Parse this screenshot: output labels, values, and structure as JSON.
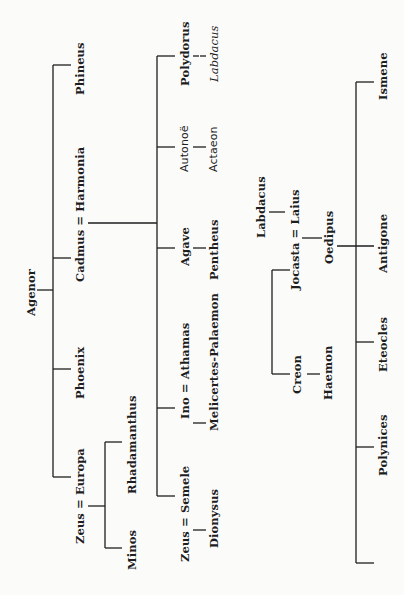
{
  "diagram": {
    "orientation": "rotated 90° counter-clockwise",
    "line_color": "#1e1e1e",
    "background": "#fbfbfa",
    "people": {
      "agenor": "Agenor",
      "phineus": "Phineus",
      "cadmus_harmonia": "Cadmus = Harmonia",
      "phoenix": "Phoenix",
      "zeus_europa": "Zeus = Europa",
      "minos": "Minos",
      "rhadamanthus": "Rhadamanthus",
      "polydorus": "Polydorus",
      "labdacus_italic": "Labdacus",
      "autonoe": "Autonoë",
      "actaeon": "Actaeon",
      "agave": "Agave",
      "pentheus": "Pentheus",
      "ino_athamas": "Ino = Athamas",
      "melicertes": "Melicertes-Palaemon",
      "zeus_semele": "Zeus = Semele",
      "dionysus": "Dionysus",
      "labdacus": "Labdacus",
      "jocasta_laius": "Jocasta = Laius",
      "oedipus": "Oedipus",
      "creon": "Creon",
      "haemon": "Haemon",
      "ismene": "Ismene",
      "antigone": "Antigone",
      "eteocles": "Eteocles",
      "polynices": "Polynices"
    },
    "relations": [
      {
        "parent": "Agenor",
        "children": [
          "Phineus",
          "Cadmus",
          "Phoenix",
          "Europa"
        ]
      },
      {
        "parents": "Zeus = Europa",
        "children": [
          "Rhadamanthus",
          "Minos"
        ]
      },
      {
        "parents": "Cadmus = Harmonia",
        "children": [
          "Polydorus",
          "Autonoë",
          "Agave",
          "Ino",
          "Semele"
        ]
      },
      {
        "parent": "Polydorus",
        "children": [
          "Labdacus"
        ]
      },
      {
        "parent": "Autonoë",
        "children": [
          "Actaeon"
        ]
      },
      {
        "parent": "Agave",
        "children": [
          "Pentheus"
        ]
      },
      {
        "parents": "Ino = Athamas",
        "children": [
          "Melicertes-Palaemon"
        ]
      },
      {
        "parents": "Zeus = Semele",
        "children": [
          "Dionysus"
        ]
      },
      {
        "parent": "Labdacus",
        "children": [
          "Laius"
        ]
      },
      {
        "parents": "Jocasta = Laius",
        "children": [
          "Oedipus"
        ]
      },
      {
        "siblings_of": "Jocasta",
        "children": [
          "Creon"
        ]
      },
      {
        "parent": "Creon",
        "children": [
          "Haemon"
        ]
      },
      {
        "parents": "Jocasta = Oedipus",
        "children": [
          "Ismene",
          "Antigone",
          "Eteocles",
          "Polynices"
        ]
      }
    ]
  }
}
